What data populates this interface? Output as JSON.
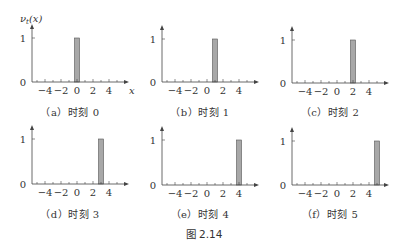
{
  "figure_caption": "图 2.14",
  "y_axis_label": "ν_t(x)",
  "x_axis_label": "x",
  "colors": {
    "bar_fill": "#a8a8a8",
    "bar_stroke": "#555555",
    "axis": "#444444"
  },
  "chart_data": [
    {
      "type": "bar",
      "title": "（a）时刻 0",
      "caption": "（a）时刻 0",
      "x": [
        0
      ],
      "values": [
        1
      ],
      "bar_width": 1,
      "xlim": [
        -5,
        5.5
      ],
      "ylim": [
        0,
        1
      ],
      "xticks": [
        -4,
        -2,
        0,
        2,
        4
      ],
      "yticks": [
        0,
        1
      ],
      "ylabel": "ν_t(x)",
      "xlabel": "x"
    },
    {
      "type": "bar",
      "title": "（b）时刻 1",
      "caption": "（b）时刻 1",
      "x": [
        1
      ],
      "values": [
        1
      ],
      "bar_width": 1,
      "xlim": [
        -5,
        5.5
      ],
      "ylim": [
        0,
        1
      ],
      "xticks": [
        -4,
        -2,
        0,
        2,
        4
      ],
      "yticks": [
        0,
        1
      ],
      "ylabel": "",
      "xlabel": ""
    },
    {
      "type": "bar",
      "title": "（c）时刻 2",
      "caption": "（c）时刻 2",
      "x": [
        2
      ],
      "values": [
        1
      ],
      "bar_width": 1,
      "xlim": [
        -5,
        5.5
      ],
      "ylim": [
        0,
        1
      ],
      "xticks": [
        -4,
        -2,
        0,
        2,
        4
      ],
      "yticks": [
        0,
        1
      ],
      "ylabel": "",
      "xlabel": ""
    },
    {
      "type": "bar",
      "title": "（d）时刻 3",
      "caption": "（d）时刻 3",
      "x": [
        3
      ],
      "values": [
        1
      ],
      "bar_width": 1,
      "xlim": [
        -5,
        5.5
      ],
      "ylim": [
        0,
        1
      ],
      "xticks": [
        -4,
        -2,
        0,
        2,
        4
      ],
      "yticks": [
        0,
        1
      ],
      "ylabel": "",
      "xlabel": ""
    },
    {
      "type": "bar",
      "title": "（e）时刻 4",
      "caption": "（e）时刻 4",
      "x": [
        4
      ],
      "values": [
        1
      ],
      "bar_width": 1,
      "xlim": [
        -5,
        5.5
      ],
      "ylim": [
        0,
        1
      ],
      "xticks": [
        -4,
        -2,
        0,
        2,
        4
      ],
      "yticks": [
        0,
        1
      ],
      "ylabel": "",
      "xlabel": ""
    },
    {
      "type": "bar",
      "title": "（f）时刻 5",
      "caption": "（f）时刻 5",
      "x": [
        5
      ],
      "values": [
        1
      ],
      "bar_width": 1,
      "xlim": [
        -5,
        5.5
      ],
      "ylim": [
        0,
        1
      ],
      "xticks": [
        -4,
        -2,
        0,
        2,
        4
      ],
      "yticks": [
        0,
        1
      ],
      "ylabel": "",
      "xlabel": ""
    }
  ],
  "panels": [
    {
      "caption": "（a）时刻 0"
    },
    {
      "caption": "（b）时刻 1"
    },
    {
      "caption": "（c）时刻 2"
    },
    {
      "caption": "（d）时刻 3"
    },
    {
      "caption": "（e）时刻 4"
    },
    {
      "caption": "（f）时刻 5"
    }
  ]
}
